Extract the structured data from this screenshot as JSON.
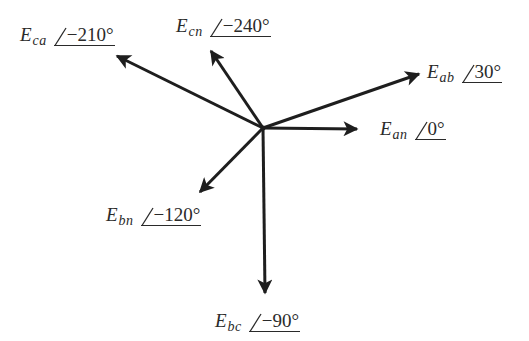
{
  "diagram": {
    "type": "phasor-diagram",
    "origin": {
      "x": 263,
      "y": 128
    },
    "line_color": "#1e1e1e",
    "text_color": "#2a2a2a",
    "phasors": [
      {
        "id": "ean",
        "symbol": "E",
        "subscript": "an",
        "angle_text": "0°",
        "angle_deg": 0,
        "tip": {
          "x": 357,
          "y": 129
        },
        "label_pos": {
          "x": 380,
          "y": 119
        }
      },
      {
        "id": "eab",
        "symbol": "E",
        "subscript": "ab",
        "angle_text": "30°",
        "angle_deg": 30,
        "tip": {
          "x": 419,
          "y": 74
        },
        "label_pos": {
          "x": 427,
          "y": 62
        }
      },
      {
        "id": "ebc",
        "symbol": "E",
        "subscript": "bc",
        "angle_text": "−90°",
        "angle_deg": -90,
        "tip": {
          "x": 265,
          "y": 293
        },
        "label_pos": {
          "x": 215,
          "y": 311
        }
      },
      {
        "id": "ebn",
        "symbol": "E",
        "subscript": "bn",
        "angle_text": "−120°",
        "angle_deg": -120,
        "tip": {
          "x": 200,
          "y": 192
        },
        "label_pos": {
          "x": 106,
          "y": 205
        }
      },
      {
        "id": "eca",
        "symbol": "E",
        "subscript": "ca",
        "angle_text": "−210°",
        "angle_deg": -210,
        "tip": {
          "x": 117,
          "y": 56
        },
        "label_pos": {
          "x": 20,
          "y": 25
        }
      },
      {
        "id": "ecn",
        "symbol": "E",
        "subscript": "cn",
        "angle_text": "−240°",
        "angle_deg": -240,
        "tip": {
          "x": 211,
          "y": 51
        },
        "label_pos": {
          "x": 176,
          "y": 16
        }
      }
    ]
  }
}
